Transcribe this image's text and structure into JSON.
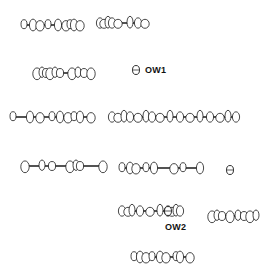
{
  "figure": {
    "type": "crystal packing diagram (thermal ellipsoid plot)",
    "labels": [
      {
        "id": "ow1",
        "text": "OW1",
        "x": 145,
        "y": 65
      },
      {
        "id": "ow2",
        "text": "OW2",
        "x": 165,
        "y": 222
      }
    ],
    "molecules": [
      {
        "y": 25,
        "x1": 24,
        "x2": 80,
        "atoms": [
          24,
          33,
          40,
          48,
          58,
          66,
          70,
          74,
          80
        ]
      },
      {
        "y": 23,
        "x1": 100,
        "x2": 145,
        "atoms": [
          100,
          104,
          108,
          112,
          118,
          130,
          138,
          145
        ]
      },
      {
        "y": 73,
        "x1": 37,
        "x2": 91,
        "atoms": [
          37,
          42,
          46,
          50,
          55,
          60,
          72,
          78,
          84,
          91
        ]
      },
      {
        "y": 117,
        "x1": 13,
        "x2": 91,
        "atoms": [
          13,
          30,
          40,
          52,
          60,
          68,
          74,
          80,
          91
        ]
      },
      {
        "y": 117,
        "x1": 112,
        "x2": 236,
        "atoms": [
          112,
          118,
          124,
          130,
          138,
          146,
          152,
          160,
          170,
          180,
          190,
          200,
          210,
          220,
          228,
          236
        ]
      },
      {
        "y": 166,
        "x1": 25,
        "x2": 103,
        "atoms": [
          25,
          42,
          52,
          70,
          76,
          80,
          103
        ]
      },
      {
        "y": 168,
        "x1": 122,
        "x2": 200,
        "atoms": [
          122,
          130,
          136,
          146,
          154,
          174,
          183,
          200
        ]
      },
      {
        "y": 211,
        "x1": 122,
        "x2": 180,
        "atoms": [
          122,
          128,
          132,
          140,
          150,
          160,
          168,
          172,
          176,
          180
        ]
      },
      {
        "y": 216,
        "x1": 212,
        "x2": 256,
        "atoms": [
          212,
          217,
          222,
          230,
          238,
          244,
          250,
          256
        ]
      },
      {
        "y": 257,
        "x1": 134,
        "x2": 190,
        "atoms": [
          134,
          140,
          146,
          152,
          160,
          166,
          176,
          180,
          190
        ]
      }
    ],
    "solitary_atoms": [
      {
        "id": "ow1-atom",
        "x": 136,
        "y": 70
      },
      {
        "id": "extra-atom",
        "x": 230,
        "y": 170
      },
      {
        "id": "ow2-atom",
        "x": 168,
        "y": 211
      }
    ],
    "colors": {
      "ink": "#1a1a1a",
      "background": "#ffffff"
    }
  }
}
